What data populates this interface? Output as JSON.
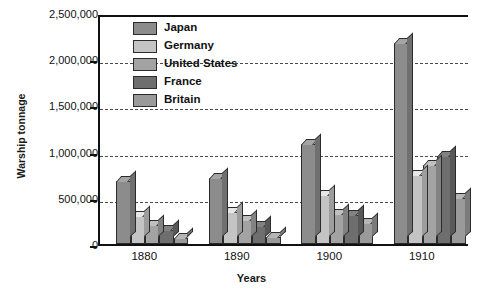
{
  "chart_data": {
    "type": "bar",
    "title": "",
    "xlabel": "Years",
    "ylabel": "Warship tonnage",
    "categories": [
      "1880",
      "1890",
      "1900",
      "1910"
    ],
    "series": [
      {
        "name": "Japan",
        "color": "#8c8c8c",
        "values": [
          680000,
          710000,
          1080000,
          2180000
        ]
      },
      {
        "name": "Germany",
        "color": "#c4c4c4",
        "values": [
          300000,
          350000,
          530000,
          750000
        ]
      },
      {
        "name": "United States",
        "color": "#a3a3a3",
        "values": [
          210000,
          255000,
          330000,
          860000
        ]
      },
      {
        "name": "France",
        "color": "#6e6e6e",
        "values": [
          150000,
          190000,
          310000,
          950000
        ]
      },
      {
        "name": "Britain",
        "color": "#9a9a9a",
        "values": [
          70000,
          80000,
          230000,
          500000
        ]
      }
    ],
    "ylim": [
      0,
      2500000
    ],
    "ytick_labels": [
      "0",
      "500,000",
      "1,000,000",
      "1,500,000",
      "2,000,000",
      "2,500,000"
    ],
    "ytick_values": [
      0,
      500000,
      1000000,
      1500000,
      2000000,
      2500000
    ],
    "grid": true,
    "grid_style": "dashed",
    "legend_position": "top-left-inside"
  }
}
